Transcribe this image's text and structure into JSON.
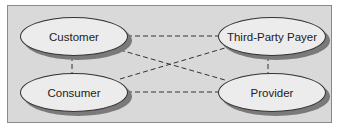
{
  "diagram": {
    "nodes": [
      {
        "id": "customer",
        "label": "Customer"
      },
      {
        "id": "consumer",
        "label": "Consumer"
      },
      {
        "id": "third_party_payer",
        "label": "Third-Party Payer"
      },
      {
        "id": "provider",
        "label": "Provider"
      }
    ],
    "edges": [
      {
        "from": "customer",
        "to": "third_party_payer",
        "style": "dashed"
      },
      {
        "from": "customer",
        "to": "provider",
        "style": "dashed"
      },
      {
        "from": "customer",
        "to": "consumer",
        "style": "dashed"
      },
      {
        "from": "consumer",
        "to": "third_party_payer",
        "style": "dashed"
      },
      {
        "from": "consumer",
        "to": "provider",
        "style": "dashed"
      },
      {
        "from": "third_party_payer",
        "to": "provider",
        "style": "dashed"
      }
    ]
  }
}
